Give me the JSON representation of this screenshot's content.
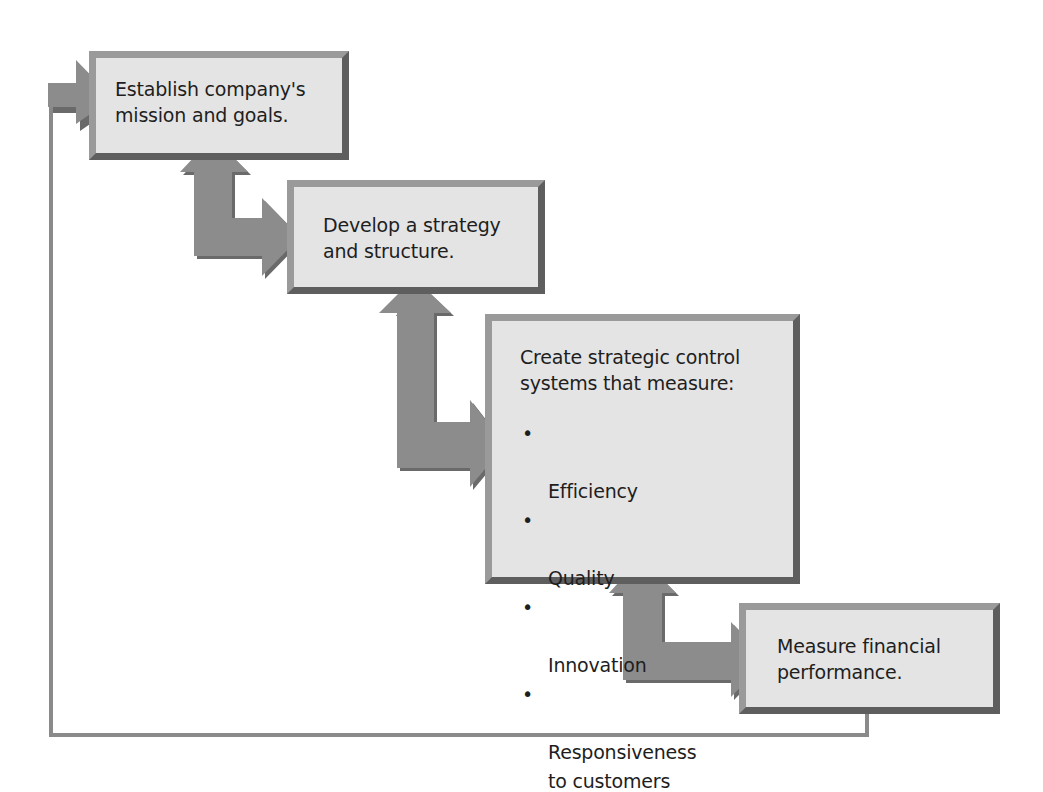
{
  "diagram": {
    "type": "strategic-control-process",
    "colors": {
      "box_fill": "#e4e4e4",
      "box_border_light": "#9a9a9a",
      "box_border_dark": "#5e5e5e",
      "arrow_fill": "#8c8c8c",
      "arrow_shadow": "#6a6a6a",
      "feedback_line": "#8a8a8a",
      "text": "#1e1e1e"
    },
    "steps": [
      {
        "id": "step-1",
        "label": "Establish company's\nmission and goals."
      },
      {
        "id": "step-2",
        "label": "Develop a strategy\nand structure."
      },
      {
        "id": "step-3",
        "label": "Create strategic control\nsystems that measure:",
        "bullet": "•",
        "items": [
          "Efficiency",
          "Quality",
          "Innovation",
          "Responsiveness\nto customers"
        ]
      },
      {
        "id": "step-4",
        "label": "Measure financial\nperformance."
      }
    ],
    "connectors": [
      {
        "from": "step-1",
        "to": "step-2",
        "style": "bidirectional-elbow-arrow"
      },
      {
        "from": "step-2",
        "to": "step-3",
        "style": "bidirectional-elbow-arrow"
      },
      {
        "from": "step-3",
        "to": "step-4",
        "style": "bidirectional-elbow-arrow"
      },
      {
        "from": "step-4",
        "to": "step-1",
        "style": "feedback-loop-line-with-arrow"
      }
    ]
  }
}
